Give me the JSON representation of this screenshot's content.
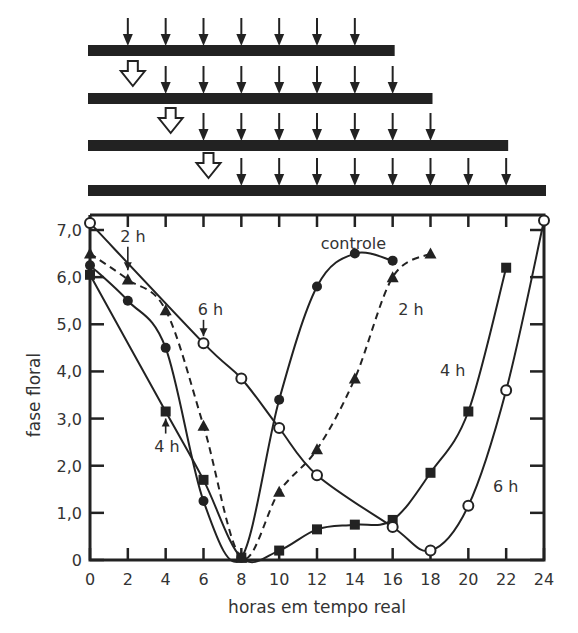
{
  "chart_data": {
    "type": "line",
    "title": "",
    "xlabel": "horas em tempo real",
    "ylabel": "fase floral",
    "xlim": [
      0,
      24
    ],
    "ylim": [
      0,
      7
    ],
    "x_ticks": [
      0,
      2,
      4,
      6,
      8,
      10,
      12,
      14,
      16,
      18,
      20,
      22,
      24
    ],
    "y_ticks": [
      {
        "value": 0,
        "label": "0"
      },
      {
        "value": 1,
        "label": "1,0"
      },
      {
        "value": 2,
        "label": "2,0"
      },
      {
        "value": 3,
        "label": "3,0"
      },
      {
        "value": 4,
        "label": "4,0"
      },
      {
        "value": 5,
        "label": "5,0"
      },
      {
        "value": 6,
        "label": "6,0"
      },
      {
        "value": 7,
        "label": "7,0"
      }
    ],
    "grid": false,
    "legend": "inline labels",
    "series": [
      {
        "name": "controle",
        "marker": "filled-circle",
        "line": "solid",
        "points": [
          [
            0,
            6.25
          ],
          [
            2,
            5.5
          ],
          [
            4,
            4.5
          ],
          [
            6,
            1.25
          ],
          [
            8,
            0.05
          ],
          [
            10,
            3.4
          ],
          [
            12,
            5.8
          ],
          [
            14,
            6.5
          ],
          [
            16,
            6.35
          ]
        ]
      },
      {
        "name": "2 h",
        "marker": "filled-triangle",
        "line": "dashed",
        "points": [
          [
            0,
            6.5
          ],
          [
            2,
            5.95
          ],
          [
            4,
            5.3
          ],
          [
            6,
            2.85
          ],
          [
            8,
            0.05
          ],
          [
            10,
            1.45
          ],
          [
            12,
            2.35
          ],
          [
            14,
            3.85
          ],
          [
            16,
            6.0
          ],
          [
            18,
            6.5
          ]
        ]
      },
      {
        "name": "4 h",
        "marker": "filled-square",
        "line": "solid",
        "points": [
          [
            0,
            6.05
          ],
          [
            4,
            3.15
          ],
          [
            6,
            1.7
          ],
          [
            8,
            0.05
          ],
          [
            10,
            0.2
          ],
          [
            12,
            0.65
          ],
          [
            14,
            0.75
          ],
          [
            16,
            0.85
          ],
          [
            18,
            1.85
          ],
          [
            20,
            3.15
          ],
          [
            22,
            6.2
          ]
        ]
      },
      {
        "name": "6 h",
        "marker": "open-circle",
        "line": "solid",
        "points": [
          [
            0,
            7.15
          ],
          [
            6,
            4.6
          ],
          [
            8,
            3.85
          ],
          [
            10,
            2.8
          ],
          [
            12,
            1.8
          ],
          [
            16,
            0.7
          ],
          [
            18,
            0.2
          ],
          [
            20,
            1.15
          ],
          [
            22,
            3.6
          ],
          [
            24,
            7.2
          ]
        ]
      }
    ],
    "annotations": [
      {
        "text": "controle",
        "x": 12.2,
        "y": 6.6
      },
      {
        "text": "2 h",
        "x": 1.6,
        "y": 6.75,
        "arrow_to": [
          2,
          6.0
        ]
      },
      {
        "text": "2 h",
        "x": 16.3,
        "y": 5.2
      },
      {
        "text": "4 h",
        "x": 3.4,
        "y": 2.3,
        "arrow_to": [
          4,
          3.15
        ]
      },
      {
        "text": "4 h",
        "x": 18.5,
        "y": 3.9
      },
      {
        "text": "6 h",
        "x": 5.7,
        "y": 5.2,
        "arrow_to": [
          6,
          4.6
        ]
      },
      {
        "text": "6 h",
        "x": 21.3,
        "y": 1.45
      }
    ],
    "schedule_diagram": {
      "description": "Four horizontal bars above the plot showing sampling times (down arrows) and treatment onset (open hollow arrows)",
      "rows": [
        {
          "bar_x": [
            0,
            16
          ],
          "sample_times": [
            2,
            4,
            6,
            8,
            10,
            12,
            14
          ],
          "treatment_arrow": null
        },
        {
          "bar_x": [
            0,
            18
          ],
          "sample_times": [
            4,
            6,
            8,
            10,
            12,
            14,
            16
          ],
          "treatment_arrow": 2
        },
        {
          "bar_x": [
            0,
            22
          ],
          "sample_times": [
            6,
            8,
            10,
            12,
            14,
            16,
            18
          ],
          "treatment_arrow": 4
        },
        {
          "bar_x": [
            0,
            24
          ],
          "sample_times": [
            8,
            10,
            12,
            14,
            16,
            18,
            20,
            22
          ],
          "treatment_arrow": 6
        }
      ]
    }
  }
}
